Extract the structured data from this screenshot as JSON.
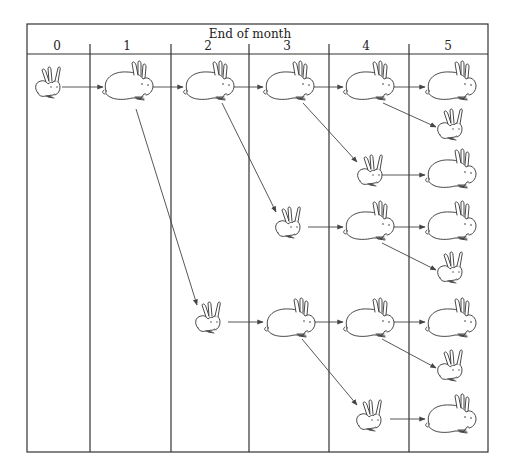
{
  "header": {
    "title": "End of month",
    "months": [
      "0",
      "1",
      "2",
      "3",
      "4",
      "5"
    ]
  },
  "legend": {
    "young_pair_icon": "young-rabbit-pair-icon",
    "adult_pair_icon": "adult-rabbit-pair-icon"
  },
  "columns_x": [
    27,
    90,
    171,
    249,
    329,
    409,
    488
  ],
  "rabbits": [
    {
      "id": "m0a",
      "month": 0,
      "type": "young",
      "x": 48,
      "y": 85
    },
    {
      "id": "m1a",
      "month": 1,
      "type": "adult",
      "x": 127,
      "y": 85
    },
    {
      "id": "m2a",
      "month": 2,
      "type": "adult",
      "x": 208,
      "y": 85
    },
    {
      "id": "m2b",
      "month": 2,
      "type": "young",
      "x": 208,
      "y": 320
    },
    {
      "id": "m3a",
      "month": 3,
      "type": "adult",
      "x": 288,
      "y": 85
    },
    {
      "id": "m3b",
      "month": 3,
      "type": "young",
      "x": 288,
      "y": 225
    },
    {
      "id": "m3c",
      "month": 3,
      "type": "adult",
      "x": 289,
      "y": 322
    },
    {
      "id": "m4a",
      "month": 4,
      "type": "adult",
      "x": 368,
      "y": 85
    },
    {
      "id": "m4b",
      "month": 4,
      "type": "young",
      "x": 370,
      "y": 173
    },
    {
      "id": "m4c",
      "month": 4,
      "type": "adult",
      "x": 368,
      "y": 225
    },
    {
      "id": "m4d",
      "month": 4,
      "type": "adult",
      "x": 368,
      "y": 322
    },
    {
      "id": "m4e",
      "month": 4,
      "type": "young",
      "x": 369,
      "y": 418
    },
    {
      "id": "m5a",
      "month": 5,
      "type": "adult",
      "x": 450,
      "y": 85
    },
    {
      "id": "m5b",
      "month": 5,
      "type": "young",
      "x": 450,
      "y": 127
    },
    {
      "id": "m5c",
      "month": 5,
      "type": "adult",
      "x": 450,
      "y": 173
    },
    {
      "id": "m5d",
      "month": 5,
      "type": "adult",
      "x": 450,
      "y": 225
    },
    {
      "id": "m5e",
      "month": 5,
      "type": "young",
      "x": 450,
      "y": 270
    },
    {
      "id": "m5f",
      "month": 5,
      "type": "adult",
      "x": 450,
      "y": 322
    },
    {
      "id": "m5g",
      "month": 5,
      "type": "young",
      "x": 450,
      "y": 368
    },
    {
      "id": "m5h",
      "month": 5,
      "type": "adult",
      "x": 450,
      "y": 418
    }
  ],
  "arrows": [
    {
      "from": "m0a",
      "to": "m1a",
      "x1": 62,
      "y1": 87,
      "x2": 103,
      "y2": 87
    },
    {
      "from": "m1a",
      "to": "m2a",
      "x1": 152,
      "y1": 87,
      "x2": 183,
      "y2": 87
    },
    {
      "from": "m2a",
      "to": "m3a",
      "x1": 233,
      "y1": 87,
      "x2": 263,
      "y2": 87
    },
    {
      "from": "m3a",
      "to": "m4a",
      "x1": 313,
      "y1": 87,
      "x2": 343,
      "y2": 87
    },
    {
      "from": "m4a",
      "to": "m5a",
      "x1": 393,
      "y1": 87,
      "x2": 425,
      "y2": 87
    },
    {
      "from": "m4a",
      "to": "m5b",
      "x1": 383,
      "y1": 103,
      "x2": 436,
      "y2": 127
    },
    {
      "from": "m3a",
      "to": "m4b",
      "x1": 303,
      "y1": 103,
      "x2": 357,
      "y2": 162
    },
    {
      "from": "m4b",
      "to": "m5c",
      "x1": 382,
      "y1": 175,
      "x2": 425,
      "y2": 175
    },
    {
      "from": "m2a",
      "to": "m3b",
      "x1": 222,
      "y1": 103,
      "x2": 276,
      "y2": 212
    },
    {
      "from": "m3b",
      "to": "m4c",
      "x1": 308,
      "y1": 227,
      "x2": 343,
      "y2": 227
    },
    {
      "from": "m4c",
      "to": "m5d",
      "x1": 393,
      "y1": 227,
      "x2": 425,
      "y2": 227
    },
    {
      "from": "m4c",
      "to": "m5e",
      "x1": 382,
      "y1": 243,
      "x2": 436,
      "y2": 270
    },
    {
      "from": "m1a",
      "to": "m2b",
      "x1": 136,
      "y1": 109,
      "x2": 197,
      "y2": 305
    },
    {
      "from": "m2b",
      "to": "m3c",
      "x1": 228,
      "y1": 322,
      "x2": 263,
      "y2": 322
    },
    {
      "from": "m3c",
      "to": "m4d",
      "x1": 313,
      "y1": 322,
      "x2": 343,
      "y2": 322
    },
    {
      "from": "m4d",
      "to": "m5f",
      "x1": 393,
      "y1": 322,
      "x2": 425,
      "y2": 322
    },
    {
      "from": "m4d",
      "to": "m5g",
      "x1": 382,
      "y1": 339,
      "x2": 436,
      "y2": 368
    },
    {
      "from": "m3c",
      "to": "m4e",
      "x1": 302,
      "y1": 339,
      "x2": 357,
      "y2": 405
    },
    {
      "from": "m4e",
      "to": "m5h",
      "x1": 390,
      "y1": 419,
      "x2": 425,
      "y2": 419
    }
  ]
}
